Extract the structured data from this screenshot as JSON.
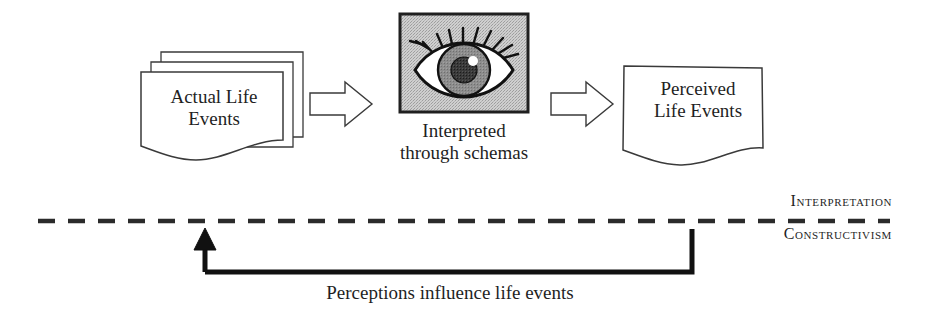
{
  "figure": {
    "kind": "conceptual-flow-diagram",
    "background_color": "#ffffff",
    "stroke_color": "#1f1f1f",
    "eye_box_fill": "#bfbfbf",
    "iris_color": "#858585",
    "pupil_color": "#2b2b2b",
    "highlight_color": "#ffffff",
    "sclera_color": "#ffffff"
  },
  "nodes": {
    "actual_life_events": {
      "label": "Actual Life\nEvents",
      "shape": "stacked-documents",
      "sheet_count": 3
    },
    "interpretation_stage": {
      "image_name": "eye-illustration",
      "caption": "Interpreted\nthrough schemas",
      "shape": "framed-image"
    },
    "perceived_life_events": {
      "label": "Perceived\nLife Events",
      "shape": "document"
    }
  },
  "connectors": {
    "arrow_1": {
      "name": "block-arrow-right",
      "from": "actual_life_events",
      "to": "interpretation_stage",
      "style": "hollow-outline"
    },
    "arrow_2": {
      "name": "block-arrow-right",
      "from": "interpretation_stage",
      "to": "perceived_life_events",
      "style": "hollow-outline"
    },
    "feedback_loop": {
      "name": "feedback-arrow",
      "caption": "Perceptions influence life events",
      "from": "perceived_life_events",
      "to": "actual_life_events",
      "style": "solid-thick-u-shape"
    }
  },
  "divider": {
    "style": "dashed",
    "above_label": "Interpretation",
    "below_label": "Constructivism"
  }
}
